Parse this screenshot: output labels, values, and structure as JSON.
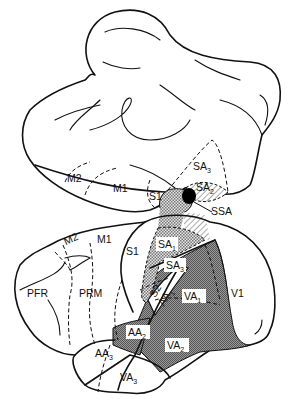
{
  "diagram": {
    "type": "brain-cortical-areas",
    "colors": {
      "line": "#111111",
      "background": "#ffffff",
      "stipple": "#888888",
      "dark_fill": "#6e6e6e",
      "ssa_fill": "#000000"
    },
    "upper_view": {
      "labels": {
        "m2": "M2",
        "m1": "M1",
        "s1": "S1",
        "sa3": {
          "base": "SA",
          "sub": "3"
        },
        "sa2": {
          "base": "SA",
          "sub": "2"
        },
        "ssa": "SSA"
      }
    },
    "lower_view": {
      "labels": {
        "m2": "M2",
        "m1": "M1",
        "s1": "S1",
        "pfr": "PFR",
        "prm": "PRM",
        "sa1": {
          "base": "SA",
          "sub": "1"
        },
        "sa3": {
          "base": "SA",
          "sub": "3"
        },
        "s2": "S2",
        "aa1": {
          "base": "AA",
          "sub": "1"
        },
        "va1": {
          "base": "VA",
          "sub": "1"
        },
        "v1": "V1",
        "aa2": {
          "base": "AA",
          "sub": "2"
        },
        "va2": {
          "base": "VA",
          "sub": "2"
        },
        "aa3": {
          "base": "AA",
          "sub": "3"
        },
        "va3": {
          "base": "VA",
          "sub": "3"
        }
      }
    }
  }
}
